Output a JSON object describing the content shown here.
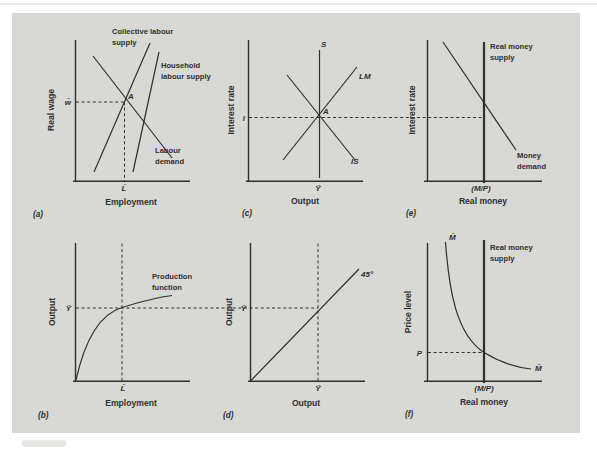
{
  "colors": {
    "card": "#d8d8d5",
    "ink": "#2f2f2f",
    "page": "#ffffff"
  },
  "panels": {
    "a": {
      "letter": "(a)",
      "y_axis": "Real wage",
      "x_axis": "Employment",
      "y_tick": "w̄",
      "x_tick": "L̄",
      "point": "A",
      "collective_supply": [
        "Collective labour",
        "supply"
      ],
      "household_supply": [
        "Household",
        "labour supply"
      ],
      "labour_demand": [
        "Labour",
        "demand"
      ]
    },
    "b": {
      "letter": "(b)",
      "y_axis": "Output",
      "x_axis": "Employment",
      "y_tick": "Ȳ",
      "x_tick": "L̄",
      "production_function": [
        "Production",
        "function"
      ]
    },
    "c": {
      "letter": "(c)",
      "y_axis": "Interest rate",
      "x_axis": "Output",
      "y_tick": "ī",
      "x_tick": "Ȳ",
      "point": "A",
      "supply_label": "S",
      "lm_label": "LM",
      "is_label": "IS"
    },
    "d": {
      "letter": "(d)",
      "y_axis": "Output",
      "x_axis": "Output",
      "y_tick": "Ȳ",
      "x_tick": "Ȳ",
      "line_label": "45°"
    },
    "e": {
      "letter": "(e)",
      "y_axis": "Interest rate",
      "x_axis": "Real money",
      "x_tick": "(M/P)",
      "money_supply": [
        "Real money",
        "supply"
      ],
      "money_demand": [
        "Money",
        "demand"
      ]
    },
    "f": {
      "letter": "(f)",
      "y_axis": "Price level",
      "x_axis": "Real money",
      "y_tick": "P",
      "x_tick": "(M/P)",
      "money_supply": [
        "Real money",
        "supply"
      ],
      "curve_label_top": "M̄",
      "curve_label_bottom": "M̄"
    }
  }
}
